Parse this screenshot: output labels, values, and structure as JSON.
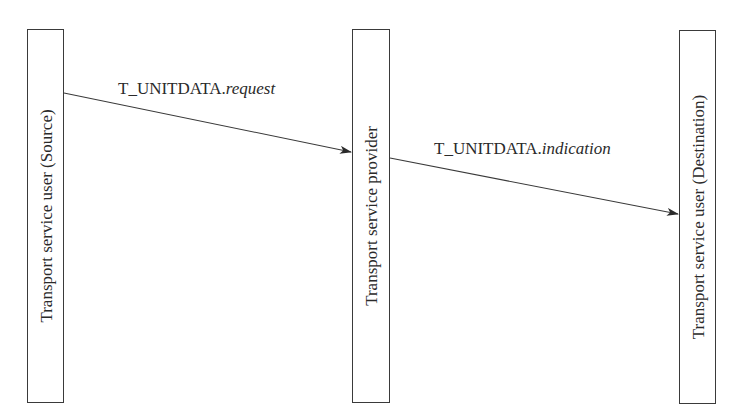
{
  "diagram": {
    "type": "sequence",
    "entities": [
      {
        "id": "source",
        "label": "Transport service user (Source)"
      },
      {
        "id": "provider",
        "label": "Transport service provider"
      },
      {
        "id": "destination",
        "label": "Transport service user (Destination)"
      }
    ],
    "messages": [
      {
        "from": "source",
        "to": "provider",
        "primitive": "T_UNITDATA.",
        "type": "request"
      },
      {
        "from": "provider",
        "to": "destination",
        "primitive": "T_UNITDATA.",
        "type": "indication"
      }
    ],
    "colors": {
      "line": "#3a3a3a",
      "text": "#2a2a2a",
      "background": "#ffffff"
    }
  }
}
